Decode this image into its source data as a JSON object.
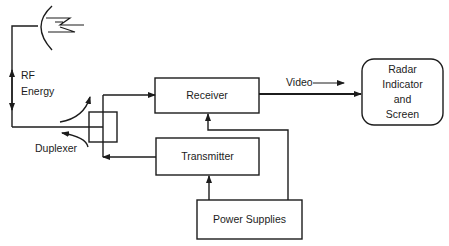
{
  "diagram": {
    "colors": {
      "stroke": "#1c1c1c",
      "background": "#ffffff"
    },
    "blocks": {
      "receiver": {
        "label": "Receiver"
      },
      "transmitter": {
        "label": "Transmitter"
      },
      "power_supplies": {
        "label": "Power Supplies"
      },
      "indicator": {
        "line1": "Radar",
        "line2": "Indicator",
        "line3": "and",
        "line4": "Screen"
      }
    },
    "labels": {
      "rf": "RF",
      "energy": "Energy",
      "duplexer": "Duplexer",
      "video": "Video"
    },
    "icons": {
      "antenna": "antenna-dish-icon",
      "lightning": "rf-wave-icon"
    }
  }
}
